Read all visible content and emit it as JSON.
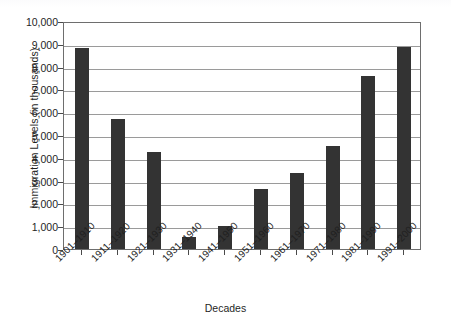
{
  "chart_data": {
    "type": "bar",
    "title": "",
    "xlabel": "Decades",
    "ylabel": "Immigration Levels (in thousands)",
    "categories": [
      "1901–1910",
      "1911–1920",
      "1921–1930",
      "1931–1940",
      "1941–1950",
      "1951–1960",
      "1961–1970",
      "1971–1980",
      "1981–1990",
      "1991–2000"
    ],
    "values": [
      8800,
      5700,
      4250,
      530,
      1000,
      2650,
      3350,
      4500,
      7600,
      8850
    ],
    "ylim": [
      0,
      10000
    ],
    "ytick_step": 1000,
    "ytick_labels": [
      "0",
      "1,000",
      "2,000",
      "3,000",
      "4,000",
      "5,000",
      "6,000",
      "7,000",
      "8,000",
      "9,000",
      "10,000"
    ],
    "grid": true,
    "grid_axis": "y",
    "legend": false,
    "legend_position": "none",
    "bar_color": "#333333",
    "grid_color": "#9a9a9a",
    "frame_color": "#6e6e6e",
    "background_color": "#ffffff",
    "xtick_label_rotation": -45
  }
}
